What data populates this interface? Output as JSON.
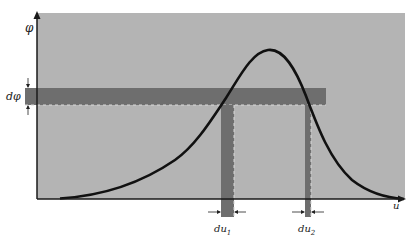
{
  "figure": {
    "colors": {
      "background": "#ffffff",
      "plot_area": "#b4b4b4",
      "band": "#6e6e6e",
      "curve": "#111111",
      "axis": "#1a1a1a",
      "dash": "#d8d8d8"
    }
  },
  "axes": {
    "y_label": "φ",
    "x_label": "u"
  },
  "labels": {
    "dphi": "dφ",
    "du1_main": "du",
    "du1_sub": "1",
    "du2_main": "du",
    "du2_sub": "2"
  },
  "geometry": {
    "origin": [
      37,
      199
    ],
    "plot_area": {
      "x": 37,
      "y": 13,
      "w": 368,
      "h": 186
    },
    "band": {
      "x": 25,
      "y": 88,
      "w": 301,
      "h": 17
    },
    "strip1": {
      "x": 221,
      "y": 105,
      "w": 13,
      "h": 112
    },
    "strip2": {
      "x": 305,
      "y": 105,
      "w": 6,
      "h": 112
    },
    "curve_peak": [
      268,
      50
    ]
  }
}
